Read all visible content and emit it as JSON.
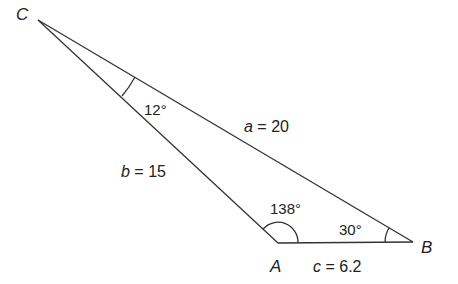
{
  "diagram": {
    "type": "triangle",
    "vertices": {
      "A": {
        "label": "A",
        "x": 278,
        "y": 243
      },
      "B": {
        "label": "B",
        "x": 413,
        "y": 242
      },
      "C": {
        "label": "C",
        "x": 38,
        "y": 20
      }
    },
    "sides": {
      "a": {
        "var": "a",
        "eq": " = 20",
        "value": 20
      },
      "b": {
        "var": "b",
        "eq": " = 15",
        "value": 15
      },
      "c": {
        "var": "c",
        "eq": " = 6.2",
        "value": 6.2
      }
    },
    "angles": {
      "A": {
        "label": "138°",
        "value": 138
      },
      "B": {
        "label": "30°",
        "value": 30
      },
      "C": {
        "label": "12°",
        "value": 12
      }
    },
    "colors": {
      "stroke": "#333333",
      "text": "#222222"
    }
  }
}
